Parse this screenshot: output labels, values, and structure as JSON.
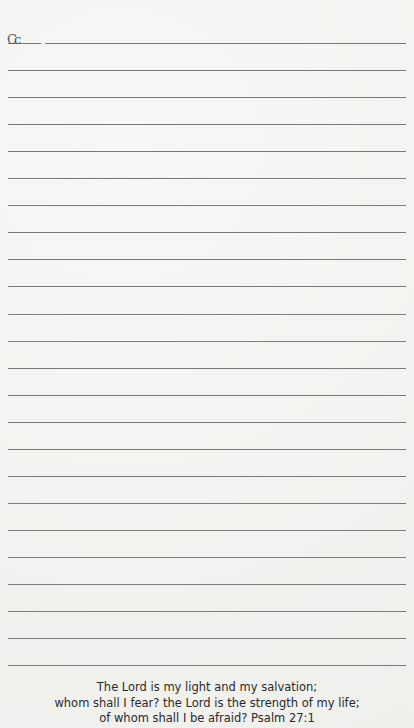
{
  "page": {
    "handwritten_mark": "Cc",
    "line_count": 24,
    "line_start_y": 43,
    "line_spacing": 27.05
  },
  "verse": {
    "lines": [
      "The Lord is my light and my salvation;",
      "whom shall I fear? the Lord is the strength of my life;",
      "of whom shall I be afraid? Psalm 27:1"
    ]
  }
}
